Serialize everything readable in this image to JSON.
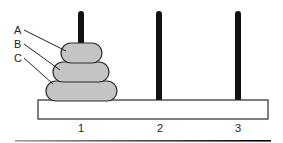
{
  "diagram": {
    "colors": {
      "disk_fill": "#c4c4c4",
      "disk_stroke": "#2a2a2a",
      "peg": "#111111",
      "base_fill": "#ffffff",
      "base_stroke": "#2a2a2a"
    },
    "disks": [
      {
        "label": "A",
        "peg": 1,
        "size": "small"
      },
      {
        "label": "B",
        "peg": 1,
        "size": "medium"
      },
      {
        "label": "C",
        "peg": 1,
        "size": "large"
      }
    ],
    "pegs": [
      {
        "label": "1"
      },
      {
        "label": "2"
      },
      {
        "label": "3"
      }
    ]
  }
}
